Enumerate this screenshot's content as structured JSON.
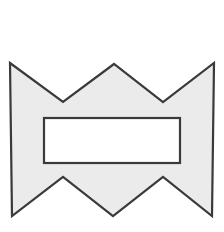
{
  "canvas": {
    "width": 224,
    "height": 232,
    "background_color": "#ffffff",
    "title": "Geometric shape figure"
  },
  "figure": {
    "name": "notched-bowtie-polygon-with-rectangular-hole",
    "fill_color": "#ebebeb",
    "stroke_color": "#3a3a3a",
    "stroke_width": 2.2,
    "outer_polygon_points": "10,63 63,102 114,64 163,102 214,63 212,216 163,177 113,216 63,177 12,216",
    "outer_vertices": [
      {
        "label": "top-left-corner",
        "x": 10,
        "y": 63
      },
      {
        "label": "top-left-valley",
        "x": 63,
        "y": 102
      },
      {
        "label": "top-center-peak",
        "x": 114,
        "y": 64
      },
      {
        "label": "top-right-valley",
        "x": 163,
        "y": 102
      },
      {
        "label": "top-right-corner",
        "x": 214,
        "y": 63
      },
      {
        "label": "bottom-right-corner",
        "x": 212,
        "y": 216
      },
      {
        "label": "bottom-right-peak",
        "x": 163,
        "y": 177
      },
      {
        "label": "bottom-center-valley",
        "x": 113,
        "y": 216
      },
      {
        "label": "bottom-left-peak",
        "x": 63,
        "y": 177
      },
      {
        "label": "bottom-left-corner",
        "x": 12,
        "y": 216
      }
    ],
    "inner_rectangle": {
      "name": "rectangular-hole",
      "x": 44,
      "y": 118,
      "width": 136,
      "height": 45,
      "fill_color": "#ffffff",
      "stroke_color": "#3a3a3a",
      "stroke_width": 2.2
    }
  }
}
